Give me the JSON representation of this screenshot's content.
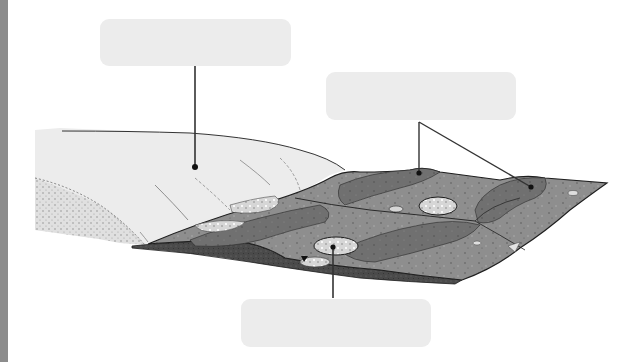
{
  "diagram": {
    "colors": {
      "background": "#ffffff",
      "edge_strip": "#8c8c8c",
      "label_box": "#ececec",
      "leader_line": "#333333",
      "glacier_ice": "#ececec",
      "glacier_shadow": "#cfcfcf",
      "outwash_plain": "#8e8e8e",
      "ridge_dark": "#6e6e6e",
      "deposit_dark": "#4a4a4a",
      "kettle_fill": "#d8d8d8",
      "outline": "#1e1e1e"
    },
    "labels": [
      {
        "id": "label-1",
        "text": "",
        "points_to": "glacier"
      },
      {
        "id": "label-2",
        "text": "",
        "points_to": "ridges on outwash plain"
      },
      {
        "id": "label-3",
        "text": "",
        "points_to": "kettle depression"
      }
    ]
  }
}
